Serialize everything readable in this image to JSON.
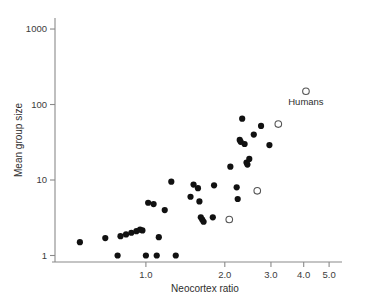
{
  "chart_data": {
    "type": "scatter",
    "title": "",
    "xlabel": "Neocortex ratio",
    "ylabel": "Mean group size",
    "xscale": "log",
    "yscale": "log",
    "xlim": [
      0.45,
      5.6
    ],
    "ylim": [
      0.82,
      1400
    ],
    "xticks": [
      1.0,
      2.0,
      3.0,
      4.0,
      5.0
    ],
    "xtick_labels": [
      "1.0",
      "2.0",
      "3.0",
      "4.0",
      "5.0"
    ],
    "yticks": [
      1,
      10,
      100,
      1000
    ],
    "ytick_labels": [
      "1",
      "10",
      "100",
      "1000"
    ],
    "grid": false,
    "legend": "none",
    "series": [
      {
        "name": "Nonhuman primates",
        "marker": "filled-circle",
        "color": "#111111",
        "points": [
          [
            0.56,
            1.5
          ],
          [
            0.7,
            1.7
          ],
          [
            0.78,
            1.0
          ],
          [
            0.8,
            1.8
          ],
          [
            0.84,
            1.9
          ],
          [
            0.88,
            2.0
          ],
          [
            0.92,
            2.1
          ],
          [
            0.95,
            2.2
          ],
          [
            0.97,
            2.15
          ],
          [
            1.0,
            1.0
          ],
          [
            1.02,
            5.0
          ],
          [
            1.07,
            4.8
          ],
          [
            1.1,
            1.0
          ],
          [
            1.12,
            1.75
          ],
          [
            1.18,
            4.0
          ],
          [
            1.25,
            9.5
          ],
          [
            1.3,
            1.0
          ],
          [
            1.48,
            6.0
          ],
          [
            1.52,
            8.7
          ],
          [
            1.58,
            7.8
          ],
          [
            1.6,
            5.2
          ],
          [
            1.62,
            3.2
          ],
          [
            1.64,
            3.0
          ],
          [
            1.66,
            2.8
          ],
          [
            1.8,
            3.2
          ],
          [
            1.82,
            8.5
          ],
          [
            2.1,
            15.0
          ],
          [
            2.22,
            8.0
          ],
          [
            2.24,
            5.6
          ],
          [
            2.28,
            34.0
          ],
          [
            2.3,
            32.0
          ],
          [
            2.33,
            65.0
          ],
          [
            2.38,
            30.0
          ],
          [
            2.42,
            17.0
          ],
          [
            2.44,
            16.0
          ],
          [
            2.48,
            19.0
          ],
          [
            2.58,
            40.0
          ],
          [
            2.75,
            52.0
          ],
          [
            2.96,
            29.0
          ]
        ]
      },
      {
        "name": "Open-circle points",
        "marker": "open-circle",
        "color": "#555555",
        "points": [
          [
            2.08,
            3.0
          ],
          [
            2.66,
            7.2
          ],
          [
            3.2,
            55.0
          ],
          [
            4.08,
            150.0
          ]
        ]
      }
    ],
    "annotations": [
      {
        "text": "Humans",
        "x": 4.08,
        "y": 150.0,
        "position": "below"
      }
    ]
  },
  "axes": {
    "x_title": "Neocortex ratio",
    "y_title": "Mean group size"
  }
}
